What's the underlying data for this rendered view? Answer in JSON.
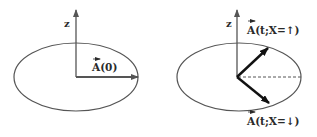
{
  "figure": {
    "panels": [
      {
        "id": "left",
        "axis_label": "z",
        "vector_label": "A(0)",
        "vector_arrow": "→",
        "description": "Vector A(0) lying horizontally in the plane"
      },
      {
        "id": "right",
        "axis_label": "z",
        "vector_up_label": "A(t;X=↑)",
        "vector_down_label": "A(t;X=↓)",
        "vector_arrow": "→",
        "description": "Vector A(t) rotating up or down depending on X"
      }
    ],
    "colors": {
      "stroke": "#555555",
      "vector": "#1a1a1a",
      "text": "#2a2a2a",
      "background": "#ffffff"
    }
  }
}
